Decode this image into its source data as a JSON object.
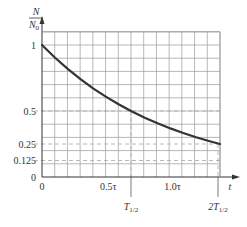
{
  "chart_data": {
    "type": "line",
    "title": "",
    "xlabel": "t",
    "ylabel": "N/N0",
    "ylabel_parts": {
      "numerator": "N",
      "denominator": "N",
      "denominator_subscript": "0"
    },
    "xlim": [
      0,
      1.4
    ],
    "ylim": [
      0,
      1.1
    ],
    "x_units": "tau",
    "grid": true,
    "grid_step": {
      "x": 0.1,
      "y": 0.1
    },
    "legend": "none",
    "y_ticks": [
      {
        "value": 1,
        "label": "1"
      },
      {
        "value": 0.5,
        "label": "0.5"
      },
      {
        "value": 0.25,
        "label": "0.25"
      },
      {
        "value": 0.125,
        "label": "0.125"
      },
      {
        "value": 0,
        "label": "0"
      }
    ],
    "x_ticks": [
      {
        "value": 0,
        "label": "0"
      },
      {
        "value": 0.5,
        "label": "0.5τ"
      },
      {
        "value": 1.0,
        "label": "1.0τ"
      }
    ],
    "annotations": [
      {
        "x": 0.693,
        "label": "T",
        "subscript": "1/2",
        "value_label": "T1/2",
        "marks_y": 0.5
      },
      {
        "x": 1.386,
        "label": "2T",
        "subscript": "1/2",
        "value_label": "2T1/2",
        "marks_y": 0.25
      }
    ],
    "dashed_reference_lines": {
      "horizontal": [
        0.5,
        0.25,
        0.125
      ],
      "vertical": [
        0.693,
        1.386
      ]
    },
    "series": [
      {
        "name": "N/N0 = e^(-t/τ)",
        "x": [
          0,
          0.1,
          0.2,
          0.3,
          0.4,
          0.5,
          0.6,
          0.693,
          0.8,
          0.9,
          1.0,
          1.1,
          1.2,
          1.3,
          1.386
        ],
        "y": [
          1.0,
          0.905,
          0.819,
          0.741,
          0.67,
          0.607,
          0.549,
          0.5,
          0.449,
          0.407,
          0.368,
          0.333,
          0.301,
          0.273,
          0.25
        ]
      }
    ],
    "colors": {
      "curve": "#333333",
      "grid": "#9a9a9a",
      "dashed": "#b0b0b0",
      "axis": "#333333"
    }
  }
}
